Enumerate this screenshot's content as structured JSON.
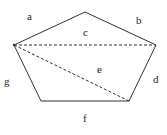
{
  "diagram": {
    "type": "pentagon",
    "vertices": [
      [
        85,
        12
      ],
      [
        156,
        45
      ],
      [
        129,
        101
      ],
      [
        41,
        101
      ],
      [
        14,
        45
      ]
    ],
    "diagonals": [
      {
        "from": [
          14,
          45
        ],
        "to": [
          156,
          45
        ],
        "style": "dashed"
      },
      {
        "from": [
          14,
          45
        ],
        "to": [
          129,
          101
        ],
        "style": "dashed"
      }
    ],
    "labels": {
      "a": "a",
      "b": "b",
      "c": "c",
      "d": "d",
      "e": "e",
      "f": "f",
      "g": "g"
    },
    "stroke_color": "#333333"
  }
}
